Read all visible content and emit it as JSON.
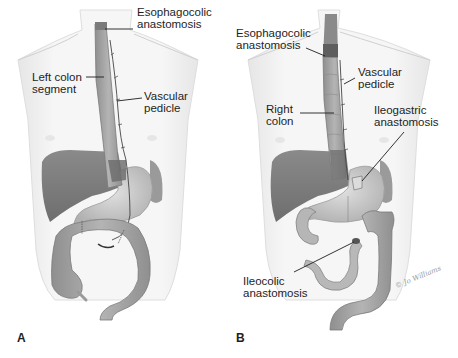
{
  "figure": {
    "style": "grayscale medical illustration",
    "colors": {
      "background": "#ffffff",
      "torso_outline": "#e3e3e3",
      "torso_fill": "#f4f4f4",
      "liver": "#7e7e7e",
      "stomach": "#cfcfcf",
      "colon": "#a9a9a9",
      "colon_dark": "#8a8a8a",
      "anastomosis_dark": "#5e5e5e",
      "leader_line": "#1e1e1e",
      "text": "#1e1e1e"
    }
  },
  "panels": [
    {
      "id": "A",
      "letter": "A",
      "title": "Left colon interposition",
      "labels": {
        "esophagocolic": "Esophagocolic\nanastomosis",
        "colon_segment": "Left colon\nsegment",
        "vascular_pedicle": "Vascular\npedicle"
      }
    },
    {
      "id": "B",
      "letter": "B",
      "title": "Right colon interposition",
      "labels": {
        "esophagocolic": "Esophagocolic\nanastomosis",
        "vascular_pedicle": "Vascular\npedicle",
        "colon_segment": "Right\ncolon",
        "ileogastric": "Ileogastric\nanastomosis",
        "ileocolic": "Ileocolic\nanastomosis"
      },
      "signature": "© Jo Williams"
    }
  ]
}
